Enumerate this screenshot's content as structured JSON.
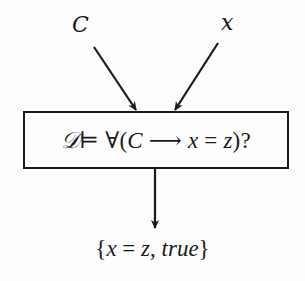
{
  "diagram": {
    "inputs": [
      {
        "id": "C",
        "label": "C"
      },
      {
        "id": "x",
        "label": "x"
      }
    ],
    "query": {
      "entails_lhs": "𝒟",
      "entails_symbol": "⊨",
      "quantifier": "∀",
      "open_paren": "(",
      "antecedent": "C",
      "implies": "⟶",
      "lhs_var": "x",
      "equals": "=",
      "rhs_var": "z",
      "close": ")?"
    },
    "output": {
      "open_brace": "{",
      "var_x": "x",
      "equals": "=",
      "var_z": "z",
      "comma": ",",
      "value": "true",
      "close_brace": "}"
    },
    "edges": [
      {
        "from": "C",
        "to": "query"
      },
      {
        "from": "x",
        "to": "query"
      },
      {
        "from": "query",
        "to": "output"
      }
    ],
    "colors": {
      "stroke": "#1a1a1a",
      "background": "#fdfdfd"
    }
  }
}
